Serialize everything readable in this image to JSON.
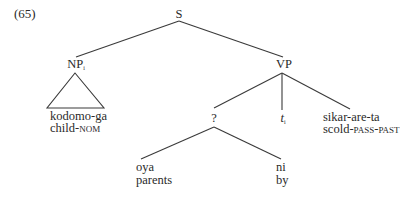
{
  "example_number": "(65)",
  "tree": {
    "root": {
      "label": "S"
    },
    "np": {
      "label": "NP",
      "index": "i",
      "words": "kodomo-ga",
      "gloss_stem": "child-",
      "gloss_tag": "NOM"
    },
    "vp": {
      "label": "VP"
    },
    "unknown": {
      "label": "?"
    },
    "trace": {
      "label": "t",
      "index": "i"
    },
    "verb": {
      "words": "sikar-are-ta",
      "gloss_stem": "scold-",
      "gloss_tag": "PASS-PAST"
    },
    "oya": {
      "words": "oya",
      "gloss": "parents"
    },
    "ni": {
      "words": "ni",
      "gloss": "by"
    }
  }
}
